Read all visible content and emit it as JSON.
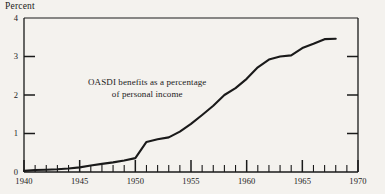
{
  "figure": {
    "background_color": "#f4f2ee",
    "ink_color": "#1a1a1a"
  },
  "chart_data": {
    "type": "line",
    "title": "",
    "ylabel": "Percent",
    "xlabel": "",
    "ylim": [
      0,
      4
    ],
    "xlim": [
      1940,
      1970
    ],
    "grid": false,
    "legend_position": "none",
    "y_ticks": [
      "4",
      "3",
      "2",
      "1",
      "0"
    ],
    "y_tick_values": [
      4,
      3,
      2,
      1,
      0
    ],
    "x_ticks": [
      "1940",
      "1945",
      "1950",
      "1955",
      "1960",
      "1965",
      "1970"
    ],
    "x_tick_values": [
      1940,
      1945,
      1950,
      1955,
      1960,
      1965,
      1970
    ],
    "x_minor_tick_interval": 1,
    "annotations": [
      {
        "line1": "OASDI benefits as a percentage",
        "line2": "of personal income"
      }
    ],
    "series": [
      {
        "name": "OASDI benefits as a percentage of personal income",
        "x": [
          1940,
          1941,
          1942,
          1943,
          1944,
          1945,
          1946,
          1947,
          1948,
          1949,
          1950,
          1951,
          1952,
          1953,
          1954,
          1955,
          1956,
          1957,
          1958,
          1959,
          1960,
          1961,
          1962,
          1963,
          1964,
          1965,
          1966,
          1967,
          1968
        ],
        "values": [
          0.03,
          0.05,
          0.06,
          0.07,
          0.09,
          0.12,
          0.17,
          0.21,
          0.25,
          0.3,
          0.36,
          0.78,
          0.85,
          0.9,
          1.05,
          1.25,
          1.48,
          1.72,
          2.0,
          2.18,
          2.42,
          2.72,
          2.92,
          3.0,
          3.03,
          3.22,
          3.33,
          3.45,
          3.46
        ]
      }
    ]
  },
  "axis_geometry": {
    "plot_left": 24,
    "plot_right": 358,
    "plot_top": 18,
    "plot_bottom": 172
  }
}
